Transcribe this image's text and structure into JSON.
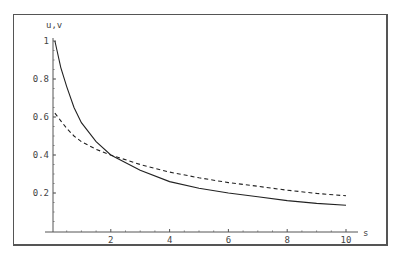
{
  "chart_data": {
    "type": "line",
    "title": "",
    "xlabel": "s",
    "ylabel": "u,v",
    "xlim": [
      0,
      10
    ],
    "ylim": [
      0,
      1
    ],
    "grid": false,
    "legend": "none",
    "x_ticks": [
      "2",
      "4",
      "6",
      "8",
      "10"
    ],
    "y_ticks": [
      "0.2",
      "0.4",
      "0.6",
      "0.8",
      "1"
    ],
    "series": [
      {
        "name": "u",
        "style": "solid",
        "x": [
          0.1,
          0.3,
          0.5,
          0.75,
          1,
          1.5,
          2,
          3,
          4,
          5,
          6,
          7,
          8,
          9,
          10
        ],
        "y": [
          1.0,
          0.86,
          0.76,
          0.65,
          0.57,
          0.47,
          0.4,
          0.32,
          0.26,
          0.225,
          0.2,
          0.18,
          0.16,
          0.145,
          0.135
        ]
      },
      {
        "name": "v",
        "style": "dashed",
        "x": [
          0.1,
          0.3,
          0.5,
          0.75,
          1,
          1.5,
          2,
          3,
          4,
          5,
          6,
          7,
          8,
          9,
          10
        ],
        "y": [
          0.62,
          0.58,
          0.54,
          0.5,
          0.47,
          0.43,
          0.4,
          0.35,
          0.31,
          0.28,
          0.255,
          0.235,
          0.215,
          0.198,
          0.185
        ]
      }
    ]
  }
}
